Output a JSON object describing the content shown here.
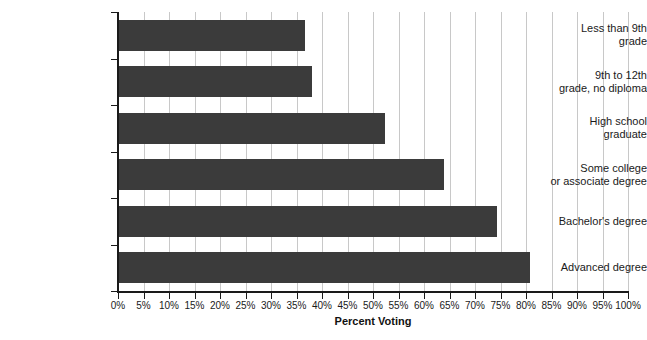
{
  "chart_data": {
    "type": "bar",
    "orientation": "horizontal",
    "title": "",
    "xlabel": "Percent Voting",
    "ylabel": "",
    "xlim": [
      0,
      100
    ],
    "xticks": [
      "0%",
      "5%",
      "10%",
      "15%",
      "20%",
      "25%",
      "30%",
      "35%",
      "40%",
      "45%",
      "50%",
      "55%",
      "60%",
      "65%",
      "70%",
      "75%",
      "80%",
      "85%",
      "90%",
      "95%",
      "100%"
    ],
    "grid": "vertical",
    "legend": null,
    "bar_color": "#3b3b3b",
    "gridline_color": "#c8c8c8",
    "axis_color": "#1a1a1a",
    "categories": [
      "Less than 9th grade",
      "9th to 12th grade, no diploma",
      "High school graduate",
      "Some college or associate degree",
      "Bachelor's degree",
      "Advanced degree"
    ],
    "category_lines": [
      [
        "Less than 9th",
        "grade"
      ],
      [
        "9th to 12th",
        "grade, no diploma"
      ],
      [
        "High school",
        "graduate"
      ],
      [
        "Some college",
        "or associate degree"
      ],
      [
        "Bachelor's degree"
      ],
      [
        "Advanced degree"
      ]
    ],
    "values": [
      36.7,
      38.0,
      52.4,
      64.0,
      74.3,
      80.8
    ]
  }
}
